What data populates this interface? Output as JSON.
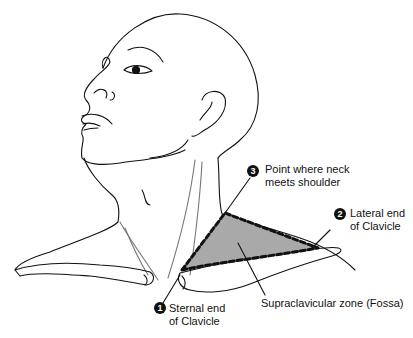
{
  "figure": {
    "type": "anatomical line drawing",
    "fill_color": "#a9a9a9",
    "line_color": "#111111"
  },
  "callouts": [
    {
      "number": "1",
      "line1": "Sternal end",
      "line2": "of Clavicle"
    },
    {
      "number": "2",
      "line1": "Lateral end",
      "line2": "of Clavicle"
    },
    {
      "number": "3",
      "line1": "Point where neck",
      "line2": "meets shoulder"
    }
  ],
  "zone_label": "Supraclavicular zone (Fossa)"
}
